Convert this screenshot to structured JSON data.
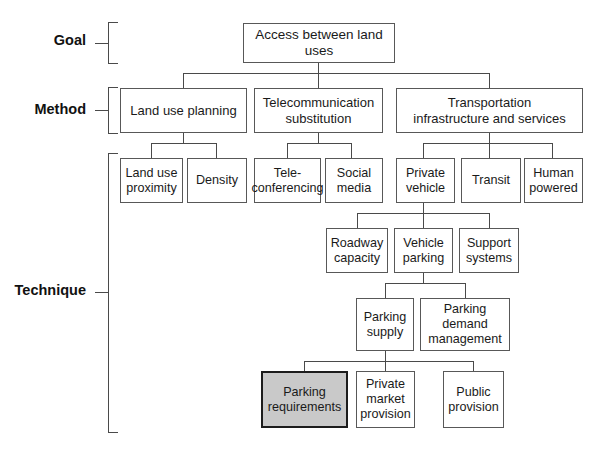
{
  "diagram": {
    "levels": [
      {
        "key": "goal",
        "label": "Goal"
      },
      {
        "key": "method",
        "label": "Method"
      },
      {
        "key": "technique",
        "label": "Technique"
      }
    ],
    "colors": {
      "box_border": "#585858",
      "box_fill": "#ffffff",
      "highlight_fill": "#c9c9c9",
      "highlight_border": "#1c1c1c",
      "connector": "#4a4a4a",
      "text": "#1a1a1a"
    },
    "nodes": {
      "goal": {
        "label": "Access between land uses",
        "level": "goal",
        "highlighted": false
      },
      "land_use_planning": {
        "label": "Land use planning",
        "level": "method",
        "highlighted": false
      },
      "telecom_substitution_l1": {
        "label": "Telecommunication",
        "level": "method",
        "highlighted": false
      },
      "telecom_substitution_l2": {
        "label": "substitution",
        "level": "method",
        "highlighted": false
      },
      "transportation_l1": {
        "label": "Transportation",
        "level": "method",
        "highlighted": false
      },
      "transportation_l2": {
        "label": "infrastructure and services",
        "level": "method",
        "highlighted": false
      },
      "land_use_proximity_l1": {
        "label": "Land use",
        "level": "technique",
        "highlighted": false
      },
      "land_use_proximity_l2": {
        "label": "proximity",
        "level": "technique",
        "highlighted": false
      },
      "density": {
        "label": "Density",
        "level": "technique",
        "highlighted": false
      },
      "teleconferencing_l1": {
        "label": "Tele-",
        "level": "technique",
        "highlighted": false
      },
      "teleconferencing_l2": {
        "label": "conferencing",
        "level": "technique",
        "highlighted": false
      },
      "social_media_l1": {
        "label": "Social",
        "level": "technique",
        "highlighted": false
      },
      "social_media_l2": {
        "label": "media",
        "level": "technique",
        "highlighted": false
      },
      "private_vehicle_l1": {
        "label": "Private",
        "level": "technique",
        "highlighted": false
      },
      "private_vehicle_l2": {
        "label": "vehicle",
        "level": "technique",
        "highlighted": false
      },
      "transit": {
        "label": "Transit",
        "level": "technique",
        "highlighted": false
      },
      "human_powered_l1": {
        "label": "Human",
        "level": "technique",
        "highlighted": false
      },
      "human_powered_l2": {
        "label": "powered",
        "level": "technique",
        "highlighted": false
      },
      "roadway_capacity_l1": {
        "label": "Roadway",
        "level": "technique",
        "highlighted": false
      },
      "roadway_capacity_l2": {
        "label": "capacity",
        "level": "technique",
        "highlighted": false
      },
      "vehicle_parking_l1": {
        "label": "Vehicle",
        "level": "technique",
        "highlighted": false
      },
      "vehicle_parking_l2": {
        "label": "parking",
        "level": "technique",
        "highlighted": false
      },
      "support_systems_l1": {
        "label": "Support",
        "level": "technique",
        "highlighted": false
      },
      "support_systems_l2": {
        "label": "systems",
        "level": "technique",
        "highlighted": false
      },
      "parking_supply_l1": {
        "label": "Parking",
        "level": "technique",
        "highlighted": false
      },
      "parking_supply_l2": {
        "label": "supply",
        "level": "technique",
        "highlighted": false
      },
      "parking_demand_l1": {
        "label": "Parking",
        "level": "technique",
        "highlighted": false
      },
      "parking_demand_l2": {
        "label": "demand",
        "level": "technique",
        "highlighted": false
      },
      "parking_demand_l3": {
        "label": "management",
        "level": "technique",
        "highlighted": false
      },
      "parking_requirements_l1": {
        "label": "Parking",
        "level": "technique",
        "highlighted": true
      },
      "parking_requirements_l2": {
        "label": "requirements",
        "level": "technique",
        "highlighted": true
      },
      "private_market_l1": {
        "label": "Private",
        "level": "technique",
        "highlighted": false
      },
      "private_market_l2": {
        "label": "market",
        "level": "technique",
        "highlighted": false
      },
      "private_market_l3": {
        "label": "provision",
        "level": "technique",
        "highlighted": false
      },
      "public_provision_l1": {
        "label": "Public",
        "level": "technique",
        "highlighted": false
      },
      "public_provision_l2": {
        "label": "provision",
        "level": "technique",
        "highlighted": false
      }
    }
  }
}
